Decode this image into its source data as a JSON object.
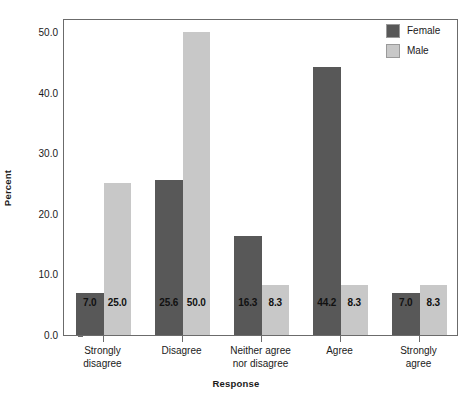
{
  "chart_data": {
    "type": "bar",
    "title": "",
    "xlabel": "Response",
    "ylabel": "Percent",
    "categories": [
      "Strongly\ndisagree",
      "Disagree",
      "Neither agree\nnor disagree",
      "Agree",
      "Strongly\nagree"
    ],
    "series": [
      {
        "name": "Female",
        "color": "#585858",
        "values": [
          7.0,
          25.6,
          16.3,
          44.2,
          7.0
        ],
        "labels": [
          "7.0",
          "25.6",
          "16.3",
          "44.2",
          "7.0"
        ]
      },
      {
        "name": "Male",
        "color": "#c8c8c8",
        "values": [
          25.0,
          50.0,
          8.3,
          8.3,
          8.3
        ],
        "labels": [
          "25.0",
          "50.0",
          "8.3",
          "8.3",
          "8.3"
        ]
      }
    ],
    "ylim": [
      0.0,
      52.3
    ],
    "yticks": [
      0.0,
      10.0,
      20.0,
      30.0,
      40.0,
      50.0
    ],
    "ytick_labels": [
      "0.0",
      "10.0",
      "20.0",
      "30.0",
      "40.0",
      "50.0"
    ],
    "grid": false,
    "legend_position": "top-right",
    "legend_entries": [
      "Female",
      "Male"
    ],
    "bar_label_position": "inside-bottom"
  },
  "axes": {
    "y_title": "Percent",
    "x_title": "Response"
  },
  "legend": {
    "items": [
      {
        "label": "Female",
        "color": "#585858"
      },
      {
        "label": "Male",
        "color": "#c8c8c8"
      }
    ]
  },
  "colors": {
    "female": "#585858",
    "male": "#c8c8c8",
    "axis": "#6b6b6b",
    "text": "#1a1a1a",
    "background": "#ffffff"
  }
}
